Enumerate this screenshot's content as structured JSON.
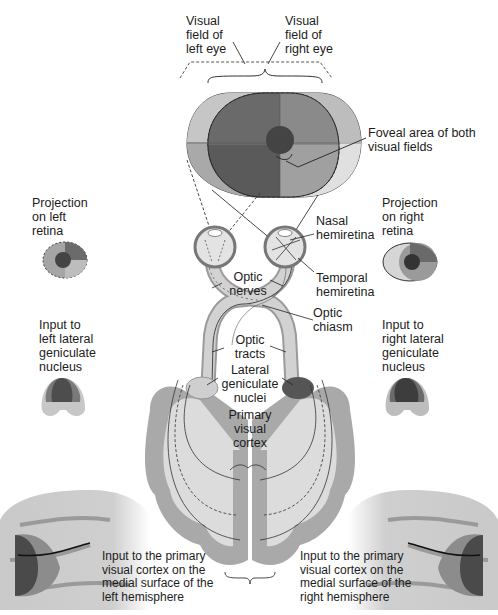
{
  "figure": {
    "colors": {
      "dark": "#4a4a4a",
      "mid_dark": "#6e6e6e",
      "mid": "#8f8f8f",
      "light": "#b8b8b8",
      "lighter": "#d4d4d4",
      "tissue_light": "#dcdcdc",
      "tissue_gray": "#a8a8a8",
      "line": "#222222"
    }
  },
  "labels": {
    "visual_field_left": "Visual\nfield of\nleft eye",
    "visual_field_right": "Visual\nfield of\nright eye",
    "foveal_area": "Foveal area of both\nvisual fields",
    "projection_left": "Projection\non left\nretina",
    "projection_right": "Projection\non right\nretina",
    "nasal_hemiretina": "Nasal\nhemiretina",
    "temporal_hemiretina": "Temporal\nhemiretina",
    "optic_nerves": "Optic\nnerves",
    "optic_chiasm": "Optic\nchiasm",
    "optic_tracts": "Optic\ntracts",
    "input_left_lgn": "Input to\nleft lateral\ngeniculate\nnucleus",
    "input_right_lgn": "Input to\nright lateral\ngeniculate\nnucleus",
    "lateral_geniculate_nuclei": "Lateral\ngeniculate\nnuclei",
    "primary_visual_cortex": "Primary\nvisual\ncortex",
    "input_cortex_left": "Input to the primary\nvisual cortex on the\nmedial surface of the\nleft hemisphere",
    "input_cortex_right": "Input to the primary\nvisual cortex on the\nmedial surface of the\nright hemisphere"
  }
}
